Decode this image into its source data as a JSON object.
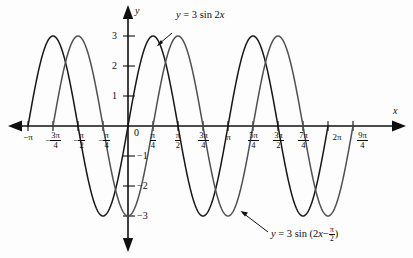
{
  "figure": {
    "background_color": "#fdfdfd",
    "axis_color": "#101010"
  },
  "axes": {
    "x_axis_label": "x",
    "y_axis_label": "y",
    "origin_label": "0"
  },
  "x_ticks": [
    {
      "label": "−π",
      "value": -3.14159265,
      "kind": "plain"
    },
    {
      "label": "−3π/4",
      "value": -2.35619449,
      "kind": "fraction",
      "sign": "−",
      "num": "3π",
      "den": "4"
    },
    {
      "label": "−π/2",
      "value": -1.57079633,
      "kind": "fraction",
      "sign": "−",
      "num": "π",
      "den": "2"
    },
    {
      "label": "−π/4",
      "value": -0.78539816,
      "kind": "fraction",
      "sign": "−",
      "num": "π",
      "den": "4"
    },
    {
      "label": "π/4",
      "value": 0.78539816,
      "kind": "fraction",
      "sign": "",
      "num": "π",
      "den": "4"
    },
    {
      "label": "π/2",
      "value": 1.57079633,
      "kind": "fraction",
      "sign": "",
      "num": "π",
      "den": "2"
    },
    {
      "label": "3π/4",
      "value": 2.35619449,
      "kind": "fraction",
      "sign": "",
      "num": "3π",
      "den": "4"
    },
    {
      "label": "π",
      "value": 3.14159265,
      "kind": "plain"
    },
    {
      "label": "5π/4",
      "value": 3.92699082,
      "kind": "fraction",
      "sign": "",
      "num": "5π",
      "den": "4"
    },
    {
      "label": "3π/2",
      "value": 4.71238898,
      "kind": "fraction",
      "sign": "",
      "num": "3π",
      "den": "2"
    },
    {
      "label": "7π/4",
      "value": 5.49778714,
      "kind": "fraction",
      "sign": "",
      "num": "7π",
      "den": "4"
    },
    {
      "label": "2π",
      "value": 6.28318531,
      "kind": "plain"
    },
    {
      "label": "9π/4",
      "value": 7.06858347,
      "kind": "fraction",
      "sign": "",
      "num": "9π",
      "den": "4"
    }
  ],
  "y_ticks": [
    {
      "label": "3",
      "value": 3
    },
    {
      "label": "2",
      "value": 2
    },
    {
      "label": "1",
      "value": 1
    },
    {
      "label": "−1",
      "value": -1
    },
    {
      "label": "−2",
      "value": -2
    },
    {
      "label": "−3",
      "value": -3
    }
  ],
  "annotations": [
    {
      "name": "curve-a-label",
      "text": "y = 3 sin 2x",
      "parts": {
        "lhs": "y",
        "eq": "=",
        "rhs_pre": "3 sin 2",
        "rhs_var": "x"
      },
      "color": "#17171a"
    },
    {
      "name": "curve-b-label",
      "text": "y = 3 sin (2x − π/2)",
      "parts": {
        "lhs": "y",
        "eq": "=",
        "rhs_pre": "3 sin (2",
        "rhs_var": "x",
        "minus": "−",
        "frac_num": "π",
        "frac_den": "2",
        "close": ")"
      },
      "color": "#4f5054"
    }
  ],
  "chart_data": {
    "type": "line",
    "title": "",
    "xlabel": "x",
    "ylabel": "y",
    "xlim": [
      -3.4906585,
      7.59218
    ],
    "ylim": [
      -3.6,
      3.6
    ],
    "grid": false,
    "legend": "inline annotations with leader lines",
    "x_tick_labels": [
      "−π",
      "−3π/4",
      "−π/2",
      "−π/4",
      "0",
      "π/4",
      "π/2",
      "3π/4",
      "π",
      "5π/4",
      "3π/2",
      "7π/4",
      "2π",
      "9π/4"
    ],
    "y_tick_labels": [
      "3",
      "2",
      "1",
      "−1",
      "−2",
      "−3"
    ],
    "series": [
      {
        "name": "y = 3 sin 2x",
        "amplitude": 3,
        "frequency": 2,
        "phase": 0,
        "period": 3.14159265,
        "color": "#17171a",
        "domain": [
          -3.14159265,
          6.28318531
        ],
        "zeros": [
          -3.14159265,
          -1.57079633,
          0,
          1.57079633,
          3.14159265,
          4.71238898,
          6.28318531
        ],
        "maxima_x": [
          -2.35619449,
          -0.78539816,
          0.78539816,
          2.35619449,
          3.92699082,
          5.49778714
        ],
        "minima_x": [
          -2.74889357,
          -1.17809725,
          1.17809725,
          2.74889357,
          4.3196899,
          5.89048623
        ]
      },
      {
        "name": "y = 3 sin (2x − π/2)",
        "amplitude": 3,
        "frequency": 2,
        "phase": -1.57079633,
        "phase_shift_x": 0.78539816,
        "period": 3.14159265,
        "color": "#4f5054",
        "domain": [
          -2.35619449,
          7.06858347
        ],
        "zeros": [
          -2.35619449,
          -0.78539816,
          0.78539816,
          2.35619449,
          3.92699082,
          5.49778714,
          7.06858347
        ],
        "maxima_x": [
          -1.57079633,
          1.57079633,
          4.71238898
        ],
        "minima_x": [
          -2.35619449,
          0,
          3.14159265,
          6.28318531
        ]
      }
    ]
  }
}
